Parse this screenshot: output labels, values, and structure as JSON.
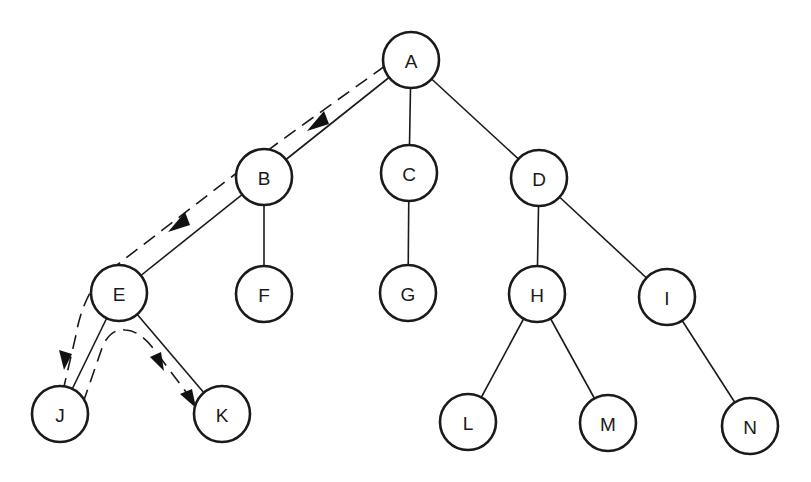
{
  "diagram": {
    "type": "tree",
    "nodes": [
      {
        "id": "A",
        "label": "A",
        "x": 411,
        "y": 60
      },
      {
        "id": "B",
        "label": "B",
        "x": 264,
        "y": 177
      },
      {
        "id": "C",
        "label": "C",
        "x": 409,
        "y": 173
      },
      {
        "id": "D",
        "label": "D",
        "x": 539,
        "y": 178
      },
      {
        "id": "E",
        "label": "E",
        "x": 119,
        "y": 293
      },
      {
        "id": "F",
        "label": "F",
        "x": 264,
        "y": 294
      },
      {
        "id": "G",
        "label": "G",
        "x": 408,
        "y": 293
      },
      {
        "id": "H",
        "label": "H",
        "x": 537,
        "y": 294
      },
      {
        "id": "I",
        "label": "I",
        "x": 667,
        "y": 297
      },
      {
        "id": "J",
        "label": "J",
        "x": 60,
        "y": 414
      },
      {
        "id": "K",
        "label": "K",
        "x": 222,
        "y": 414
      },
      {
        "id": "L",
        "label": "L",
        "x": 468,
        "y": 422
      },
      {
        "id": "M",
        "label": "M",
        "x": 608,
        "y": 423
      },
      {
        "id": "N",
        "label": "N",
        "x": 750,
        "y": 426
      }
    ],
    "edges": [
      [
        "A",
        "B"
      ],
      [
        "A",
        "C"
      ],
      [
        "A",
        "D"
      ],
      [
        "B",
        "E"
      ],
      [
        "B",
        "F"
      ],
      [
        "C",
        "G"
      ],
      [
        "D",
        "H"
      ],
      [
        "D",
        "I"
      ],
      [
        "E",
        "J"
      ],
      [
        "E",
        "K"
      ],
      [
        "H",
        "L"
      ],
      [
        "H",
        "M"
      ],
      [
        "I",
        "N"
      ]
    ],
    "traversal_path": [
      "A",
      "B",
      "E",
      "J",
      "E",
      "K"
    ],
    "node_radius": 28,
    "colors": {
      "stroke": "#1a1a1a",
      "background": "#ffffff"
    }
  }
}
